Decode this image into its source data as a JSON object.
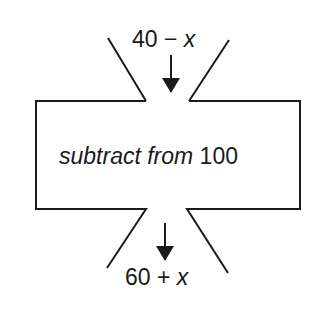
{
  "diagram": {
    "input_label": {
      "value": "40 −",
      "variable": "x"
    },
    "machine_label": {
      "operation": "subtract from",
      "operand": "100"
    },
    "output_label": {
      "value": "60 +",
      "variable": "x"
    },
    "colors": {
      "stroke": "#1a1a1a",
      "background": "#ffffff"
    }
  }
}
